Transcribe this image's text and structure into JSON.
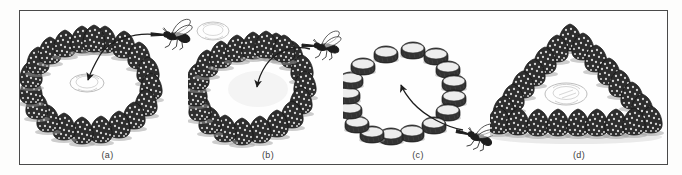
{
  "figure": {
    "kind": "scientific-line-illustration",
    "border_color": "#4a4a4a",
    "ink_color": "#2b2b2b",
    "background_color": "#fefefe",
    "panels": [
      {
        "id": "a",
        "label": "(a)",
        "marker_type": "pine-cone",
        "arrangement": "circle",
        "marker_count": 20,
        "nest_present": true,
        "nest_position": "center-of-circle",
        "insect": "digger-wasp",
        "insect_position": "upper-right-outside-circle",
        "arrow": "from-insect-to-nest-at-circle-center",
        "decoy_nest_present": false
      },
      {
        "id": "b",
        "label": "(b)",
        "marker_type": "pine-cone",
        "arrangement": "circle",
        "marker_count": 20,
        "nest_present": false,
        "nest_position": "displaced-outside-upper-left",
        "insect": "digger-wasp",
        "insect_position": "upper-right-outside-circle",
        "arrow": "from-insect-to-empty-circle-center",
        "decoy_nest_present": true
      },
      {
        "id": "c",
        "label": "(c)",
        "marker_type": "flat-stone",
        "arrangement": "circle",
        "marker_count": 16,
        "nest_present": false,
        "insect": "digger-wasp",
        "insect_position": "lower-right-outside-circle",
        "arrow": "from-insect-to-circle-center",
        "decoy_nest_present": false
      },
      {
        "id": "d",
        "label": "(d)",
        "marker_type": "pine-cone",
        "arrangement": "triangle",
        "marker_count": 22,
        "nest_present": true,
        "nest_position": "center-of-triangle",
        "insect": null,
        "arrow": null,
        "decoy_nest_present": false
      }
    ]
  }
}
